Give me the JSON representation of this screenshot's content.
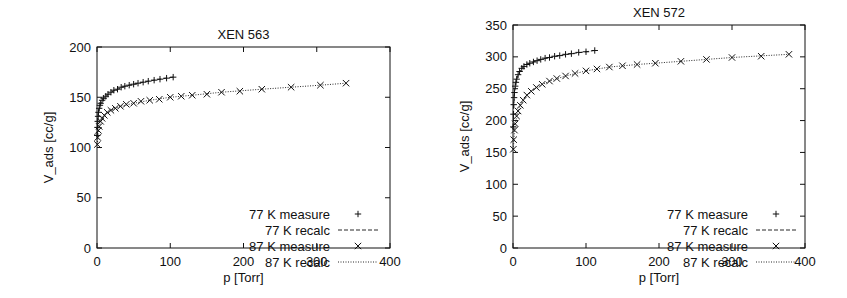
{
  "chart_data": [
    {
      "type": "scatter",
      "title": "XEN 563",
      "xlabel": "p [Torr]",
      "ylabel": "V_ads [cc/g]",
      "xlim": [
        0,
        400
      ],
      "ylim": [
        0,
        200
      ],
      "xticks": [
        0,
        100,
        200,
        300,
        400
      ],
      "yticks": [
        0,
        50,
        100,
        150,
        200
      ],
      "grid": false,
      "legend_position": "lower right",
      "series": [
        {
          "name": "77 K measure",
          "marker": "+",
          "x": [
            0.3,
            0.6,
            1,
            1.5,
            2,
            3,
            4,
            5,
            7,
            9,
            12,
            15,
            19,
            23,
            28,
            33,
            38,
            44,
            50,
            56,
            63,
            70,
            78,
            86,
            95,
            104
          ],
          "y": [
            112,
            120,
            126,
            131,
            135,
            139,
            142,
            144,
            147,
            149,
            151,
            153,
            155,
            157,
            158,
            160,
            161,
            162,
            163,
            164,
            165,
            166,
            167,
            168,
            169,
            170
          ]
        },
        {
          "name": "77 K recalc",
          "line": "dashed",
          "x": [
            0.3,
            1,
            2,
            4,
            7,
            12,
            19,
            28,
            38,
            50,
            63,
            78,
            95,
            104
          ],
          "y": [
            112,
            126,
            135,
            142,
            147,
            151,
            155,
            158,
            161,
            163,
            165,
            167,
            169,
            170
          ]
        },
        {
          "name": "87 K measure",
          "marker": "x",
          "x": [
            0.5,
            1,
            2,
            3,
            5,
            7,
            10,
            14,
            19,
            25,
            32,
            40,
            50,
            60,
            72,
            85,
            100,
            115,
            130,
            150,
            170,
            195,
            225,
            265,
            305,
            340
          ],
          "y": [
            103,
            110,
            117,
            121,
            126,
            129,
            132,
            135,
            137,
            139,
            141,
            143,
            144,
            146,
            147,
            148,
            150,
            151,
            152,
            153,
            155,
            156,
            158,
            160,
            162,
            164
          ]
        },
        {
          "name": "87 K recalc",
          "line": "dotted",
          "x": [
            0.5,
            2,
            5,
            10,
            19,
            32,
            50,
            72,
            100,
            130,
            170,
            225,
            265,
            305,
            340
          ],
          "y": [
            103,
            117,
            126,
            132,
            137,
            141,
            144,
            147,
            150,
            152,
            155,
            158,
            160,
            162,
            164
          ]
        }
      ]
    },
    {
      "type": "scatter",
      "title": "XEN 572",
      "xlabel": "p [Torr]",
      "ylabel": "V_ads [cc/g]",
      "xlim": [
        0,
        400
      ],
      "ylim": [
        0,
        350
      ],
      "xticks": [
        0,
        100,
        200,
        300,
        400
      ],
      "yticks": [
        0,
        50,
        100,
        150,
        200,
        250,
        300,
        350
      ],
      "grid": false,
      "legend_position": "lower right",
      "series": [
        {
          "name": "77 K measure",
          "marker": "+",
          "x": [
            0.3,
            0.6,
            1,
            1.5,
            2,
            3,
            4,
            5,
            7,
            9,
            12,
            15,
            19,
            23,
            28,
            33,
            38,
            44,
            50,
            57,
            64,
            72,
            80,
            90,
            100,
            112
          ],
          "y": [
            190,
            210,
            225,
            236,
            244,
            254,
            260,
            265,
            272,
            277,
            282,
            285,
            288,
            290,
            292,
            294,
            296,
            298,
            299,
            301,
            302,
            304,
            305,
            307,
            308,
            310
          ]
        },
        {
          "name": "77 K recalc",
          "line": "dashed",
          "x": [
            0.3,
            1,
            2,
            4,
            7,
            12,
            19,
            28,
            38,
            50,
            64,
            80,
            100,
            112
          ],
          "y": [
            190,
            225,
            244,
            260,
            272,
            282,
            288,
            292,
            296,
            299,
            302,
            305,
            308,
            310
          ]
        },
        {
          "name": "87 K measure",
          "marker": "x",
          "x": [
            0.5,
            1,
            2,
            3,
            5,
            7,
            10,
            14,
            19,
            25,
            32,
            40,
            50,
            60,
            72,
            85,
            100,
            115,
            132,
            150,
            170,
            195,
            230,
            265,
            300,
            340,
            378
          ],
          "y": [
            155,
            170,
            185,
            195,
            207,
            215,
            224,
            232,
            240,
            246,
            252,
            257,
            262,
            266,
            270,
            274,
            278,
            281,
            284,
            286,
            288,
            290,
            293,
            296,
            299,
            301,
            304
          ]
        },
        {
          "name": "87 K recalc",
          "line": "dotted",
          "x": [
            0.5,
            2,
            5,
            10,
            19,
            32,
            50,
            72,
            100,
            132,
            170,
            230,
            300,
            378
          ],
          "y": [
            155,
            185,
            207,
            224,
            240,
            252,
            262,
            270,
            278,
            284,
            288,
            293,
            299,
            304
          ]
        }
      ]
    }
  ]
}
